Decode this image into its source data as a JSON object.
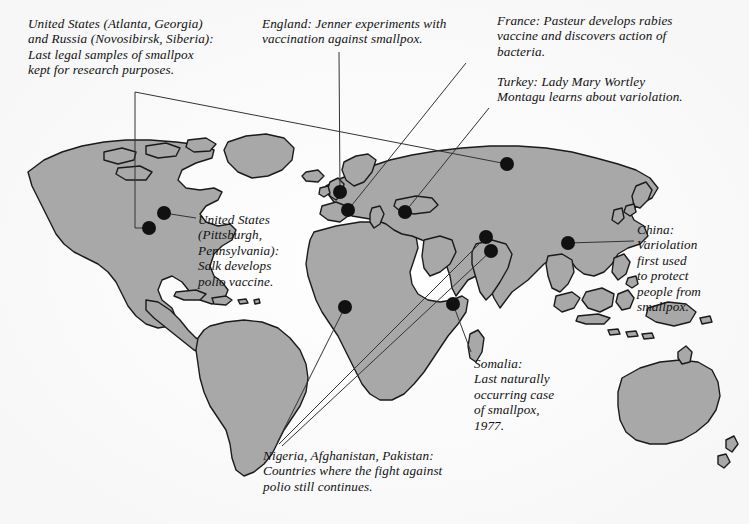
{
  "figure": {
    "type": "annotated-world-map",
    "background_color": "#ffffff",
    "land_fill": "#a8a8a8",
    "land_stroke": "#1a1a1a",
    "marker_color": "#111111",
    "leader_line_color": "#333333"
  },
  "annotations": [
    {
      "id": "us-russia-samples",
      "text": "United States (Atlanta, Georgia)\nand Russia (Novosibirsk, Siberia):\nLast legal samples of smallpox\nkept for research purposes.",
      "places": [
        "United States (Atlanta, Georgia)",
        "Russia (Novosibirsk, Siberia)"
      ]
    },
    {
      "id": "england-jenner",
      "text": "England: Jenner experiments with\nvaccination against smallpox.",
      "places": [
        "England"
      ]
    },
    {
      "id": "france-pasteur",
      "text": "France: Pasteur develops rabies\nvaccine and discovers action of\nbacteria.",
      "places": [
        "France"
      ]
    },
    {
      "id": "turkey-montagu",
      "text": "Turkey: Lady Mary Wortley\nMontagu learns about variolation.",
      "places": [
        "Turkey"
      ]
    },
    {
      "id": "us-salk",
      "text": "United States\n(Pittsburgh,\nPennsylvania):\nSalk develops\npolio vaccine.",
      "places": [
        "United States (Pittsburgh, Pennsylvania)"
      ]
    },
    {
      "id": "china-variolation",
      "text": "China:\nVariolation\nfirst used\nto protect\npeople from\nsmallpox.",
      "places": [
        "China"
      ]
    },
    {
      "id": "somalia-last-case",
      "text": "Somalia:\nLast naturally\noccurring case\nof smallpox,\n1977.",
      "places": [
        "Somalia"
      ]
    },
    {
      "id": "polio-countries",
      "text": "Nigeria, Afghanistan, Pakistan:\nCountries where the fight against\npolio still continues.",
      "places": [
        "Nigeria",
        "Afghanistan",
        "Pakistan"
      ]
    }
  ],
  "markers": [
    {
      "id": "marker-pittsburgh",
      "label": "United States (Pittsburgh, Pennsylvania)",
      "x": 164,
      "y": 213,
      "r": 7
    },
    {
      "id": "marker-atlanta",
      "label": "United States (Atlanta, Georgia)",
      "x": 149,
      "y": 228,
      "r": 7
    },
    {
      "id": "marker-england",
      "label": "England",
      "x": 340,
      "y": 192,
      "r": 7
    },
    {
      "id": "marker-france",
      "label": "France",
      "x": 348,
      "y": 210,
      "r": 7
    },
    {
      "id": "marker-turkey",
      "label": "Turkey",
      "x": 405,
      "y": 212,
      "r": 7
    },
    {
      "id": "marker-russia",
      "label": "Russia (Novosibirsk, Siberia)",
      "x": 507,
      "y": 164,
      "r": 7
    },
    {
      "id": "marker-afghanistan",
      "label": "Afghanistan",
      "x": 486,
      "y": 237,
      "r": 7
    },
    {
      "id": "marker-pakistan",
      "label": "Pakistan",
      "x": 491,
      "y": 251,
      "r": 7
    },
    {
      "id": "marker-china",
      "label": "China",
      "x": 568,
      "y": 243,
      "r": 7
    },
    {
      "id": "marker-nigeria",
      "label": "Nigeria",
      "x": 345,
      "y": 307,
      "r": 7
    },
    {
      "id": "marker-somalia",
      "label": "Somalia",
      "x": 453,
      "y": 304,
      "r": 7
    }
  ],
  "leader_lines": [
    {
      "id": "line-atlanta",
      "from": "us-russia-samples",
      "to": "marker-atlanta",
      "points": "135,92 135,228 149,228"
    },
    {
      "id": "line-russia",
      "from": "us-russia-samples",
      "to": "marker-russia",
      "points": "135,92 507,164"
    },
    {
      "id": "line-england",
      "from": "england-jenner",
      "to": "marker-england",
      "points": "339,52 340,192"
    },
    {
      "id": "line-france",
      "from": "france-pasteur",
      "to": "marker-france",
      "points": "466,63 348,210"
    },
    {
      "id": "line-turkey",
      "from": "turkey-montagu",
      "to": "marker-turkey",
      "points": "489,108 405,212"
    },
    {
      "id": "line-salk",
      "from": "us-salk",
      "to": "marker-pittsburgh",
      "points": "196,218 164,213"
    },
    {
      "id": "line-china",
      "from": "china-variolation",
      "to": "marker-china",
      "points": "634,241 568,243"
    },
    {
      "id": "line-somalia",
      "from": "somalia-last-case",
      "to": "marker-somalia",
      "points": "471,352 453,304"
    },
    {
      "id": "line-nigeria",
      "from": "polio-countries",
      "to": "marker-nigeria",
      "points": "277,443 345,307"
    },
    {
      "id": "line-afghanistan",
      "from": "polio-countries",
      "to": "marker-afghanistan",
      "points": "279,444 486,237"
    },
    {
      "id": "line-pakistan",
      "from": "polio-countries",
      "to": "marker-pakistan",
      "points": "282,446 491,251"
    }
  ]
}
